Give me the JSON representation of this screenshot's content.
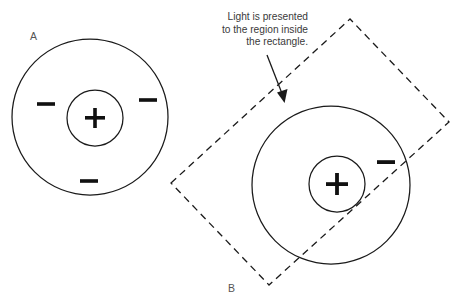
{
  "figure": {
    "background_color": "#ffffff",
    "ink_color": "#1a1a1a",
    "width": 463,
    "height": 307,
    "panels": [
      {
        "id": "A",
        "label": "A",
        "label_x": 30,
        "label_y": 40,
        "outer_circle": {
          "cx": 90,
          "cy": 117,
          "r": 78
        },
        "inner_circle": {
          "cx": 95,
          "cy": 118,
          "r": 28
        },
        "center_sign": {
          "symbol": "+",
          "x": 95,
          "y": 118
        },
        "negative_signs": [
          {
            "symbol": "−",
            "x": 46,
            "y": 104
          },
          {
            "symbol": "−",
            "x": 148,
            "y": 100
          },
          {
            "symbol": "−",
            "x": 89,
            "y": 181
          }
        ],
        "illuminated": false
      },
      {
        "id": "B",
        "label": "B",
        "label_x": 228,
        "label_y": 292,
        "outer_circle": {
          "cx": 331,
          "cy": 185,
          "r": 79
        },
        "inner_circle": {
          "cx": 337,
          "cy": 184,
          "r": 28
        },
        "center_sign": {
          "symbol": "+",
          "x": 337,
          "y": 184
        },
        "negative_signs": [
          {
            "symbol": "−",
            "x": 386,
            "y": 162
          }
        ],
        "illuminated": true,
        "light_region": {
          "shape": "rotated-rectangle",
          "style": "dashed",
          "corners": [
            {
              "x": 171,
              "y": 183
            },
            {
              "x": 350,
              "y": 19
            },
            {
              "x": 449,
              "y": 122
            },
            {
              "x": 269,
              "y": 285
            }
          ]
        }
      }
    ],
    "annotation": {
      "lines": [
        "Light is presented",
        "to the region inside",
        "the rectangle."
      ],
      "text_block": {
        "right": 155,
        "top": 11
      },
      "arrow": {
        "from": {
          "x": 267,
          "y": 55
        },
        "to": {
          "x": 284,
          "y": 102
        }
      }
    }
  }
}
